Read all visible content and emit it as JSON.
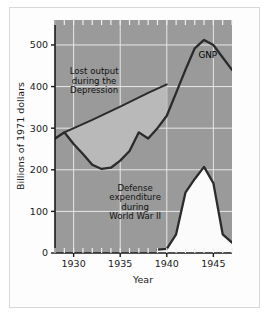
{
  "figure": {
    "background_color": "#ffffff",
    "frame_color": "#d8d8d8",
    "plot_background_color": "#9a9a9a",
    "grid_color": "#e8e8e8",
    "line_color": "#2b2b2b",
    "lost_output_fill": "#b9b9b9",
    "defense_fill": "#fbfbfb"
  },
  "chart_data": {
    "type": "line",
    "title": "",
    "xlabel": "Year",
    "ylabel": "Billions of 1971 dollars",
    "xlim": [
      1928,
      1947
    ],
    "ylim": [
      0,
      560
    ],
    "xticks": [
      1930,
      1935,
      1940,
      1945
    ],
    "xtick_labels": [
      "1930",
      "1935",
      "1940",
      "1945"
    ],
    "yticks": [
      0,
      100,
      200,
      300,
      400,
      500
    ],
    "ytick_labels": [
      "0",
      "100",
      "200",
      "300",
      "400",
      "500"
    ],
    "minor_xtick_interval": 1,
    "grid": true,
    "legend": "none",
    "series": [
      {
        "name": "GNP",
        "label": "GNP",
        "x": [
          1928,
          1929,
          1930,
          1931,
          1932,
          1933,
          1934,
          1935,
          1936,
          1937,
          1938,
          1939,
          1940,
          1941,
          1942,
          1943,
          1944,
          1945,
          1946,
          1947
        ],
        "values": [
          275,
          290,
          262,
          238,
          212,
          202,
          205,
          222,
          245,
          290,
          275,
          300,
          330,
          385,
          440,
          492,
          512,
          500,
          470,
          440
        ]
      },
      {
        "name": "Potential output trend",
        "label": "",
        "x": [
          1928,
          1929,
          1932,
          1935,
          1938,
          1940
        ],
        "values": [
          275,
          290,
          320,
          352,
          385,
          405
        ]
      },
      {
        "name": "Defense expenditure",
        "label": "Defense expenditure during World War II",
        "x": [
          1939,
          1940,
          1941,
          1942,
          1943,
          1944,
          1945,
          1946,
          1947
        ],
        "values": [
          8,
          10,
          45,
          145,
          178,
          207,
          168,
          45,
          25
        ]
      }
    ],
    "annotations": [
      {
        "name": "lost-output-annotation",
        "lines": [
          "Lost output",
          "during the",
          "Depression"
        ],
        "x": 1932.2,
        "y": 430
      },
      {
        "name": "defense-annotation",
        "lines": [
          "Defense",
          "expenditure",
          "during",
          "World War II"
        ],
        "x": 1936.6,
        "y": 150
      },
      {
        "name": "gnp-series-label",
        "lines": [
          "GNP"
        ],
        "x": 1943.4,
        "y": 468
      }
    ]
  }
}
